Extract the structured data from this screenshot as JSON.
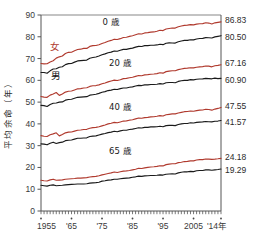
{
  "chart_data": {
    "type": "line",
    "title": "",
    "xlabel": "",
    "ylabel": "平均余命（年）",
    "xlim": [
      1955,
      2014
    ],
    "ylim": [
      0,
      90
    ],
    "grid": false,
    "legend_position": "inline-annotations",
    "y_ticks": [
      0,
      10,
      20,
      30,
      40,
      50,
      60,
      70,
      80,
      90
    ],
    "y_tick_labels": [
      "0",
      "10",
      "20",
      "30",
      "40",
      "50",
      "60",
      "70",
      "80",
      "90"
    ],
    "x_ticks": [
      1955,
      1965,
      1975,
      1985,
      1995,
      2005,
      2014
    ],
    "x_tick_labels": [
      "1955",
      "'65",
      "'75",
      "'85",
      "'95",
      "2005",
      "'14年"
    ],
    "x_minor_tick_interval": 1,
    "annotations": [
      {
        "text": "0 歳",
        "x": 1978,
        "y": 85.5
      },
      {
        "text": "20 歳",
        "x": 1981,
        "y": 66.5
      },
      {
        "text": "40 歳",
        "x": 1981,
        "y": 46.5
      },
      {
        "text": "65 歳",
        "x": 1981,
        "y": 26.0
      },
      {
        "text": "女",
        "x": 1959.5,
        "y": 74.0
      },
      {
        "text": "男",
        "x": 1960.0,
        "y": 60.5
      }
    ],
    "end_labels": [
      {
        "text": "86.83",
        "series": "0歳 女",
        "color": "#b03a2e"
      },
      {
        "text": "80.50",
        "series": "0歳 男",
        "color": "#1a1a1a"
      },
      {
        "text": "67.16",
        "series": "20歳 女",
        "color": "#b03a2e"
      },
      {
        "text": "60.90",
        "series": "20歳 男",
        "color": "#1a1a1a"
      },
      {
        "text": "47.55",
        "series": "40歳 女",
        "color": "#b03a2e"
      },
      {
        "text": "41.57",
        "series": "40歳 男",
        "color": "#1a1a1a"
      },
      {
        "text": "24.18",
        "series": "65歳 女",
        "color": "#b03a2e"
      },
      {
        "text": "19.29",
        "series": "65歳 男",
        "color": "#1a1a1a"
      }
    ],
    "colors": {
      "female": "#b03a2e",
      "male": "#1a1a1a",
      "frame": "#555555"
    },
    "x": [
      1955,
      1956,
      1957,
      1958,
      1959,
      1960,
      1961,
      1962,
      1963,
      1964,
      1965,
      1966,
      1967,
      1968,
      1969,
      1970,
      1971,
      1972,
      1973,
      1974,
      1975,
      1976,
      1977,
      1978,
      1979,
      1980,
      1981,
      1982,
      1983,
      1984,
      1985,
      1986,
      1987,
      1988,
      1989,
      1990,
      1991,
      1992,
      1993,
      1994,
      1995,
      1996,
      1997,
      1998,
      1999,
      2000,
      2001,
      2002,
      2003,
      2004,
      2005,
      2006,
      2007,
      2008,
      2009,
      2010,
      2011,
      2012,
      2013,
      2014
    ],
    "series": [
      {
        "name": "0歳 女",
        "age": 0,
        "sex": "female",
        "color": "#b03a2e",
        "values": [
          67.75,
          67.54,
          67.6,
          68.4,
          69.0,
          70.19,
          70.79,
          71.16,
          72.34,
          72.87,
          72.92,
          73.61,
          74.15,
          74.3,
          74.67,
          74.66,
          75.58,
          75.94,
          76.02,
          76.31,
          76.89,
          77.35,
          77.95,
          78.33,
          78.89,
          78.76,
          79.13,
          79.66,
          79.78,
          80.18,
          80.48,
          80.93,
          81.39,
          81.3,
          81.77,
          81.9,
          82.11,
          82.22,
          82.51,
          82.98,
          82.85,
          83.59,
          83.82,
          84.01,
          83.99,
          84.6,
          84.93,
          85.23,
          85.33,
          85.59,
          85.49,
          85.81,
          85.99,
          86.05,
          86.44,
          86.3,
          85.9,
          86.41,
          86.61,
          86.83
        ]
      },
      {
        "name": "0歳 男",
        "age": 0,
        "sex": "male",
        "color": "#1a1a1a",
        "values": [
          63.6,
          63.59,
          63.24,
          64.36,
          65.21,
          65.32,
          66.03,
          66.23,
          67.21,
          67.67,
          67.74,
          68.35,
          68.91,
          69.05,
          69.18,
          69.31,
          70.17,
          70.5,
          70.7,
          71.16,
          71.73,
          72.15,
          72.69,
          72.97,
          73.46,
          73.35,
          73.79,
          74.22,
          74.2,
          74.54,
          74.78,
          75.23,
          75.61,
          75.54,
          75.91,
          75.92,
          76.11,
          76.09,
          76.25,
          76.57,
          76.38,
          77.01,
          77.19,
          77.16,
          77.1,
          77.72,
          78.07,
          78.32,
          78.36,
          78.64,
          78.56,
          79.0,
          79.19,
          79.29,
          79.59,
          79.55,
          79.44,
          79.94,
          80.21,
          80.5
        ]
      },
      {
        "name": "20歳 女",
        "age": 20,
        "sex": "female",
        "color": "#b03a2e",
        "values": [
          52.6,
          52.3,
          52.2,
          53.2,
          53.7,
          54.4,
          53.1,
          53.7,
          54.6,
          55.0,
          55.1,
          55.6,
          56.1,
          56.2,
          56.5,
          56.6,
          57.2,
          57.5,
          57.6,
          57.9,
          58.4,
          58.8,
          59.3,
          59.7,
          60.1,
          59.9,
          60.3,
          60.8,
          60.9,
          61.2,
          61.4,
          61.8,
          62.2,
          62.1,
          62.5,
          62.6,
          62.8,
          62.9,
          63.1,
          63.5,
          63.3,
          64.0,
          64.2,
          64.4,
          64.4,
          64.9,
          65.2,
          65.5,
          65.6,
          65.8,
          65.7,
          66.0,
          66.2,
          66.3,
          66.6,
          66.5,
          66.2,
          66.7,
          66.9,
          67.16
        ]
      },
      {
        "name": "20歳 男",
        "age": 20,
        "sex": "male",
        "color": "#1a1a1a",
        "values": [
          48.5,
          48.4,
          48.0,
          48.9,
          49.5,
          49.6,
          50.0,
          50.1,
          50.9,
          51.2,
          51.3,
          51.8,
          52.2,
          52.3,
          52.4,
          52.5,
          53.2,
          53.4,
          53.6,
          54.0,
          54.5,
          54.8,
          55.3,
          55.5,
          55.9,
          55.8,
          56.2,
          56.5,
          56.5,
          56.8,
          57.0,
          57.4,
          57.7,
          57.6,
          57.9,
          57.9,
          58.1,
          58.1,
          58.2,
          58.5,
          58.3,
          58.9,
          59.0,
          59.0,
          58.9,
          59.5,
          59.8,
          60.0,
          60.0,
          60.3,
          60.2,
          60.5,
          60.6,
          60.7,
          60.9,
          60.8,
          60.7,
          61.0,
          60.8,
          60.9
        ]
      },
      {
        "name": "40歳 女",
        "age": 40,
        "sex": "female",
        "color": "#b03a2e",
        "values": [
          34.6,
          34.3,
          34.2,
          35.0,
          35.4,
          35.9,
          34.5,
          35.1,
          35.9,
          36.2,
          36.3,
          36.7,
          37.1,
          37.2,
          37.4,
          37.5,
          38.0,
          38.3,
          38.4,
          38.7,
          39.1,
          39.5,
          40.0,
          40.3,
          40.7,
          40.5,
          40.9,
          41.3,
          41.4,
          41.7,
          41.9,
          42.3,
          42.7,
          42.6,
          42.9,
          43.0,
          43.2,
          43.3,
          43.5,
          43.8,
          43.6,
          44.2,
          44.4,
          44.6,
          44.6,
          45.0,
          45.3,
          45.6,
          45.7,
          45.9,
          45.8,
          46.1,
          46.3,
          46.4,
          46.7,
          46.6,
          46.3,
          46.8,
          47.1,
          47.55
        ]
      },
      {
        "name": "40歳 男",
        "age": 40,
        "sex": "male",
        "color": "#1a1a1a",
        "values": [
          30.8,
          30.7,
          30.4,
          31.1,
          31.6,
          31.0,
          31.4,
          31.6,
          32.3,
          32.5,
          32.6,
          33.0,
          33.4,
          33.4,
          33.5,
          33.6,
          34.2,
          34.4,
          34.5,
          34.9,
          35.3,
          35.6,
          36.0,
          36.2,
          36.6,
          36.4,
          36.8,
          37.1,
          37.1,
          37.4,
          37.6,
          37.9,
          38.2,
          38.1,
          38.4,
          38.4,
          38.6,
          38.6,
          38.7,
          38.9,
          38.7,
          39.2,
          39.3,
          39.3,
          39.2,
          39.7,
          40.0,
          40.2,
          40.2,
          40.5,
          40.4,
          40.7,
          40.8,
          40.9,
          41.1,
          41.0,
          40.9,
          41.2,
          41.3,
          41.57
        ]
      },
      {
        "name": "65歳 女",
        "age": 65,
        "sex": "female",
        "color": "#b03a2e",
        "values": [
          14.1,
          13.9,
          13.8,
          14.3,
          14.6,
          14.1,
          14.2,
          14.3,
          14.6,
          14.7,
          14.8,
          14.9,
          15.1,
          15.1,
          15.2,
          15.3,
          15.6,
          15.8,
          15.9,
          16.2,
          16.6,
          16.9,
          17.2,
          17.5,
          17.9,
          17.7,
          18.0,
          18.3,
          18.4,
          18.6,
          18.9,
          19.2,
          19.6,
          19.5,
          19.8,
          20.0,
          20.2,
          20.3,
          20.5,
          20.8,
          20.7,
          21.3,
          21.5,
          21.7,
          21.7,
          22.2,
          22.4,
          22.7,
          22.8,
          23.0,
          23.0,
          23.4,
          23.6,
          23.6,
          23.9,
          23.8,
          23.7,
          23.8,
          23.97,
          24.18
        ]
      },
      {
        "name": "65歳 男",
        "age": 65,
        "sex": "male",
        "color": "#1a1a1a",
        "values": [
          11.8,
          11.6,
          11.4,
          11.8,
          12.0,
          11.6,
          11.7,
          11.8,
          12.0,
          12.1,
          12.2,
          12.3,
          12.4,
          12.4,
          12.4,
          12.5,
          12.8,
          12.9,
          13.0,
          13.2,
          13.7,
          13.9,
          14.2,
          14.3,
          14.6,
          14.6,
          14.8,
          15.0,
          15.1,
          15.2,
          15.5,
          15.7,
          16.0,
          15.9,
          16.1,
          16.2,
          16.3,
          16.3,
          16.4,
          16.6,
          16.5,
          16.9,
          17.0,
          17.1,
          17.0,
          17.5,
          17.8,
          18.0,
          18.0,
          18.2,
          18.1,
          18.5,
          18.6,
          18.6,
          18.9,
          18.9,
          18.7,
          18.9,
          19.08,
          19.29
        ]
      }
    ]
  },
  "figure": {
    "y_axis_title": "平均余命（年）"
  }
}
